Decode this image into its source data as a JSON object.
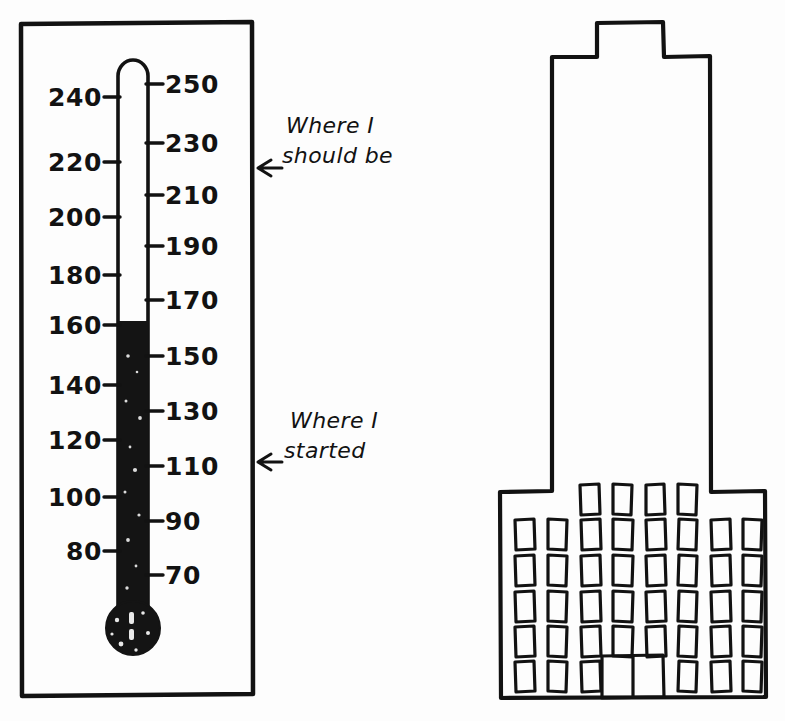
{
  "page": {
    "background_color": "#fdfdfd",
    "ink_color": "#121212",
    "width": 785,
    "height": 721
  },
  "thermometer": {
    "name": "fundraising-thermometer",
    "frame": {
      "x": 20,
      "y": 22,
      "width": 233,
      "height": 673
    },
    "scale": {
      "min": 60,
      "max": 255,
      "left_labels": [
        "240",
        "220",
        "200",
        "180",
        "160",
        "140",
        "120",
        "100",
        "80"
      ],
      "right_labels": [
        "250",
        "230",
        "210",
        "190",
        "170",
        "150",
        "130",
        "110",
        "90",
        "70"
      ],
      "left_values": [
        240,
        220,
        200,
        180,
        160,
        140,
        120,
        100,
        80
      ],
      "right_values": [
        250,
        230,
        210,
        190,
        170,
        150,
        130,
        110,
        90,
        70
      ],
      "unit_hint": ""
    },
    "fill": {
      "current_value": 160,
      "fill_color": "#141414",
      "bulb_filled": true
    },
    "tube": {
      "center_x": 133,
      "top_y": 60,
      "bottom_y": 600,
      "width": 30
    },
    "bulb": {
      "center_x": 133,
      "center_y": 628,
      "radius": 27
    }
  },
  "annotations": [
    {
      "name": "annotation-should-be",
      "line1": "Where I",
      "line2": "should be",
      "arrow_x": 258,
      "arrow_y": 168,
      "text_x": 284,
      "text_y": 137,
      "points_to_value": 220
    },
    {
      "name": "annotation-started",
      "line1": "Where I",
      "line2": "started",
      "arrow_x": 258,
      "arrow_y": 462,
      "text_x": 284,
      "text_y": 432,
      "points_to_value": 110
    }
  ],
  "building": {
    "name": "office-building-drawing",
    "outline_points": "597,22 663,22 663,57 710,57 710,492 765,492 765,698 500,698 500,492 552,492 552,57 597,57 597,22",
    "tower": {
      "top_width": 66,
      "mid_width": 158,
      "base_width": 265
    },
    "window_grid": {
      "tower_row_count": 1,
      "tower_row_windows": 4,
      "base_row_count": 5,
      "base_row_windows": 8,
      "total_windows": 42,
      "window_width": 19,
      "window_height": 30
    },
    "door": {
      "name": "main-entrance-door",
      "x": 600,
      "y": 655,
      "width": 62,
      "height": 43,
      "panels": 2
    }
  }
}
